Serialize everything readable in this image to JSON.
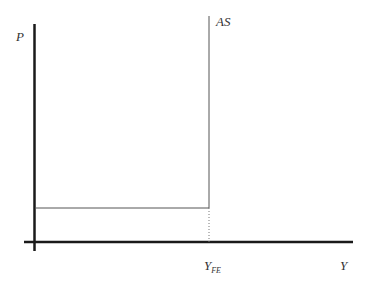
{
  "diagram": {
    "type": "aggregate-supply",
    "y_axis_label": "P",
    "x_axis_label": "Y",
    "curve_label": "AS",
    "x_tick_label": {
      "main": "Y",
      "subscript": "FE"
    },
    "colors": {
      "axis": "#1a1a1a",
      "curve": "#555555",
      "dotted": "#777777",
      "text": "#333333"
    }
  }
}
